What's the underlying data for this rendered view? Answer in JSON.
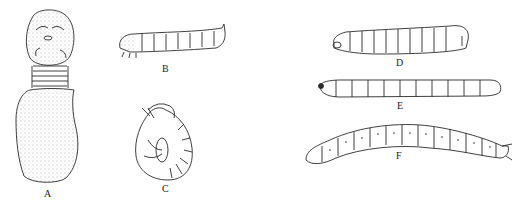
{
  "figure": {
    "panels": [
      {
        "id": "A",
        "label": "A",
        "description": "grub-like larva with large rounded head, ringed neck segments, and swollen sac-like body"
      },
      {
        "id": "B",
        "label": "B",
        "description": "caterpillar (eruciform) larva with thoracic legs and prolegs"
      },
      {
        "id": "C",
        "label": "C",
        "description": "C-shaped curled scarabaeiform larva"
      },
      {
        "id": "D",
        "label": "D",
        "description": "legless cylindrical larva with enlarged rear segment"
      },
      {
        "id": "E",
        "label": "E",
        "description": "slender segmented wireworm-like larva"
      },
      {
        "id": "F",
        "label": "F",
        "description": "long segmented larva with spotted segments and forked tail"
      }
    ],
    "colors": {
      "ink": "#2a2a2a",
      "stipple": "#555555",
      "background": "#ffffff"
    }
  }
}
